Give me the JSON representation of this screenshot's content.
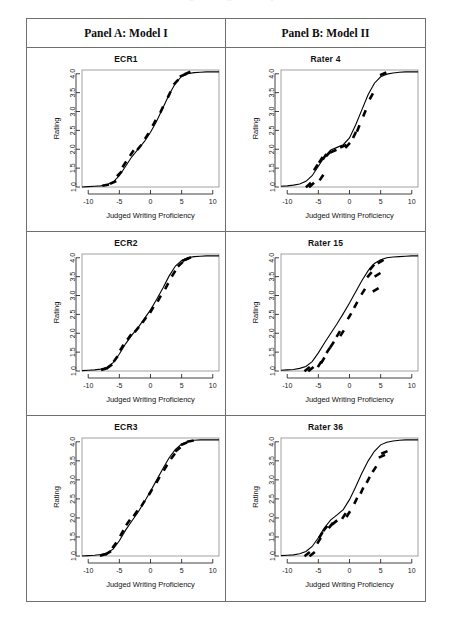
{
  "page": {
    "top_cutoff_text": "Judged Writing Proficiency"
  },
  "figure": {
    "panels": [
      {
        "id": "panel-a",
        "header": "Panel A: Model I"
      },
      {
        "id": "panel-b",
        "header": "Panel B: Model II"
      }
    ],
    "charts": [
      {
        "row": 0,
        "col": 0,
        "title": "ECR1"
      },
      {
        "row": 0,
        "col": 1,
        "title": "Rater 4"
      },
      {
        "row": 1,
        "col": 0,
        "title": "ECR2"
      },
      {
        "row": 1,
        "col": 1,
        "title": "Rater 15"
      },
      {
        "row": 2,
        "col": 0,
        "title": "ECR3"
      },
      {
        "row": 2,
        "col": 1,
        "title": "Rater 36"
      }
    ]
  },
  "chart_data": [
    {
      "id": "ecr1",
      "type": "line",
      "title": "ECR1",
      "panel": "Panel A: Model I",
      "xlabel": "Judged Writing Proficiency",
      "ylabel": "Rating",
      "xlim": [
        -11,
        11
      ],
      "ylim": [
        1.0,
        4.1
      ],
      "xticks": [
        -10,
        -5,
        0,
        5,
        10
      ],
      "yticks": [
        1.0,
        1.5,
        2.0,
        2.5,
        3.0,
        3.5,
        4.0
      ],
      "ytick_labels": [
        "1.0",
        "1.5",
        "2.0",
        "2.5",
        "3.0",
        "3.5",
        "4.0"
      ],
      "xtick_labels": [
        "-10",
        "-5",
        "0",
        "5",
        "10"
      ],
      "grid": false,
      "legend": "none",
      "series": [
        {
          "name": "model-I fitted curve",
          "kind": "curve",
          "x": [
            -11,
            -10,
            -9,
            -8,
            -7,
            -6,
            -5,
            -4,
            -3,
            -2,
            -1,
            0,
            1,
            2,
            3,
            4,
            5,
            6,
            7,
            8,
            9,
            10,
            11
          ],
          "y": [
            1.0,
            1.01,
            1.02,
            1.03,
            1.06,
            1.13,
            1.3,
            1.55,
            1.8,
            2.0,
            2.2,
            2.45,
            2.75,
            3.1,
            3.45,
            3.75,
            3.93,
            4.0,
            4.03,
            4.04,
            4.05,
            4.05,
            4.05
          ]
        },
        {
          "name": "observed residual segments",
          "kind": "segments",
          "x": [
            -7.2,
            -6.0,
            -5.0,
            -4.2,
            -3.0,
            -1.8,
            -0.6,
            0.6,
            1.8,
            3.0,
            4.1,
            5.2,
            5.9
          ],
          "y": [
            1.05,
            1.12,
            1.35,
            1.6,
            1.9,
            2.05,
            2.35,
            2.7,
            3.05,
            3.45,
            3.78,
            3.96,
            4.02
          ]
        }
      ]
    },
    {
      "id": "rater4",
      "type": "line",
      "title": "Rater 4",
      "panel": "Panel B: Model II",
      "xlabel": "Judged Writing Proficiency",
      "ylabel": "Rating",
      "xlim": [
        -11,
        11
      ],
      "ylim": [
        1.0,
        4.1
      ],
      "xticks": [
        -10,
        -5,
        0,
        5,
        10
      ],
      "yticks": [
        1.0,
        1.5,
        2.0,
        2.5,
        3.0,
        3.5,
        4.0
      ],
      "ytick_labels": [
        "1.0",
        "1.5",
        "2.0",
        "2.5",
        "3.0",
        "3.5",
        "4.0"
      ],
      "xtick_labels": [
        "-10",
        "-5",
        "0",
        "5",
        "10"
      ],
      "grid": false,
      "legend": "none",
      "series": [
        {
          "name": "model-II fitted curve",
          "kind": "curve",
          "x": [
            -11,
            -10,
            -9,
            -8,
            -7,
            -6,
            -5,
            -4,
            -3,
            -2,
            -1,
            0,
            1,
            2,
            3,
            4,
            5,
            6,
            7,
            8,
            9,
            10,
            11
          ],
          "y": [
            1.02,
            1.03,
            1.05,
            1.08,
            1.15,
            1.3,
            1.55,
            1.8,
            1.98,
            2.05,
            2.12,
            2.3,
            2.65,
            3.05,
            3.45,
            3.75,
            3.92,
            3.99,
            4.02,
            4.04,
            4.05,
            4.05,
            4.05
          ]
        },
        {
          "name": "observed residual segments",
          "kind": "segments",
          "x": [
            -6.6,
            -6.1,
            -5.4,
            -4.6,
            -4.5,
            -4.0,
            -3.4,
            -2.6,
            -1.0,
            -0.3,
            0.8,
            1.4,
            2.4,
            3.5,
            5.4
          ],
          "y": [
            1.05,
            1.05,
            1.52,
            1.72,
            1.25,
            1.8,
            1.88,
            1.95,
            2.08,
            2.1,
            2.38,
            2.55,
            2.95,
            3.4,
            4.0
          ]
        }
      ]
    },
    {
      "id": "ecr2",
      "type": "line",
      "title": "ECR2",
      "panel": "Panel A: Model I",
      "xlabel": "Judged Writing Proficiency",
      "ylabel": "Rating",
      "xlim": [
        -11,
        11
      ],
      "ylim": [
        1.0,
        4.1
      ],
      "xticks": [
        -10,
        -5,
        0,
        5,
        10
      ],
      "yticks": [
        1.0,
        1.5,
        2.0,
        2.5,
        3.0,
        3.5,
        4.0
      ],
      "ytick_labels": [
        "1.0",
        "1.5",
        "2.0",
        "2.5",
        "3.0",
        "3.5",
        "4.0"
      ],
      "xtick_labels": [
        "-10",
        "-5",
        "0",
        "5",
        "10"
      ],
      "grid": false,
      "legend": "none",
      "series": [
        {
          "name": "model-I fitted curve",
          "kind": "curve",
          "x": [
            -11,
            -10,
            -9,
            -8,
            -7,
            -6,
            -5,
            -4,
            -3,
            -2,
            -1,
            0,
            1,
            2,
            3,
            4,
            5,
            6,
            7,
            8,
            9,
            10,
            11
          ],
          "y": [
            1.01,
            1.02,
            1.03,
            1.05,
            1.1,
            1.22,
            1.45,
            1.72,
            1.95,
            2.15,
            2.38,
            2.62,
            2.9,
            3.2,
            3.52,
            3.78,
            3.93,
            4.0,
            4.03,
            4.04,
            4.05,
            4.05,
            4.05
          ]
        },
        {
          "name": "observed residual segments",
          "kind": "segments",
          "x": [
            -7.4,
            -6.6,
            -5.6,
            -4.6,
            -3.4,
            -2.2,
            -1.0,
            0.2,
            1.4,
            2.6,
            3.7,
            4.8,
            5.6,
            6.0
          ],
          "y": [
            1.05,
            1.12,
            1.32,
            1.62,
            1.9,
            2.1,
            2.35,
            2.62,
            2.92,
            3.25,
            3.58,
            3.83,
            3.95,
            3.98
          ]
        }
      ]
    },
    {
      "id": "rater15",
      "type": "line",
      "title": "Rater 15",
      "panel": "Panel B: Model II",
      "xlabel": "Judged Writing Proficiency",
      "ylabel": "Rating",
      "xlim": [
        -11,
        11
      ],
      "ylim": [
        1.0,
        4.1
      ],
      "xticks": [
        -10,
        -5,
        0,
        5,
        10
      ],
      "yticks": [
        1.0,
        1.5,
        2.0,
        2.5,
        3.0,
        3.5,
        4.0
      ],
      "ytick_labels": [
        "1.0",
        "1.5",
        "2.0",
        "2.5",
        "3.0",
        "3.5",
        "4.0"
      ],
      "xtick_labels": [
        "-10",
        "-5",
        "0",
        "5",
        "10"
      ],
      "grid": false,
      "legend": "none",
      "series": [
        {
          "name": "model-II fitted curve",
          "kind": "curve",
          "x": [
            -11,
            -10,
            -9,
            -8,
            -7,
            -6,
            -5,
            -4,
            -3,
            -2,
            -1,
            0,
            1,
            2,
            3,
            4,
            5,
            6,
            7,
            8,
            9,
            10,
            11
          ],
          "y": [
            1.02,
            1.03,
            1.04,
            1.07,
            1.12,
            1.25,
            1.48,
            1.75,
            2.0,
            2.25,
            2.52,
            2.8,
            3.1,
            3.4,
            3.66,
            3.85,
            3.95,
            4.0,
            4.02,
            4.03,
            4.04,
            4.05,
            4.05
          ]
        },
        {
          "name": "observed residual segments",
          "kind": "segments",
          "x": [
            -6.8,
            -6.2,
            -4.8,
            -4.3,
            -3.4,
            -2.8,
            -1.8,
            -1.2,
            0.0,
            1.0,
            2.2,
            3.2,
            3.6,
            4.2,
            4.5,
            5.0
          ],
          "y": [
            1.05,
            1.05,
            1.18,
            1.28,
            1.55,
            1.7,
            1.98,
            2.0,
            2.45,
            2.75,
            3.1,
            3.55,
            3.75,
            3.15,
            3.55,
            3.9
          ]
        }
      ]
    },
    {
      "id": "ecr3",
      "type": "line",
      "title": "ECR3",
      "panel": "Panel A: Model I",
      "xlabel": "Judged Writing Proficiency",
      "ylabel": "Rating",
      "xlim": [
        -11,
        11
      ],
      "ylim": [
        1.0,
        4.1
      ],
      "xticks": [
        -10,
        -5,
        0,
        5,
        10
      ],
      "yticks": [
        1.0,
        1.5,
        2.0,
        2.5,
        3.0,
        3.5,
        4.0
      ],
      "ytick_labels": [
        "1.0",
        "1.5",
        "2.0",
        "2.5",
        "3.0",
        "3.5",
        "4.0"
      ],
      "xtick_labels": [
        "-10",
        "-5",
        "0",
        "5",
        "10"
      ],
      "grid": false,
      "legend": "none",
      "series": [
        {
          "name": "model-I fitted curve",
          "kind": "curve",
          "x": [
            -11,
            -10,
            -9,
            -8,
            -7,
            -6,
            -5,
            -4,
            -3,
            -2,
            -1,
            0,
            1,
            2,
            3,
            4,
            5,
            6,
            7,
            8,
            9,
            10,
            11
          ],
          "y": [
            1.0,
            1.01,
            1.02,
            1.04,
            1.08,
            1.18,
            1.4,
            1.68,
            1.92,
            2.15,
            2.42,
            2.7,
            3.0,
            3.3,
            3.58,
            3.8,
            3.94,
            4.01,
            4.04,
            4.05,
            4.05,
            4.05,
            4.05
          ]
        },
        {
          "name": "observed residual segments",
          "kind": "segments",
          "x": [
            -7.6,
            -6.8,
            -5.8,
            -4.6,
            -3.6,
            -2.4,
            -1.2,
            0.0,
            1.2,
            2.4,
            3.6,
            4.4,
            5.4,
            6.4
          ],
          "y": [
            1.03,
            1.08,
            1.28,
            1.6,
            1.88,
            2.12,
            2.38,
            2.68,
            3.0,
            3.32,
            3.62,
            3.8,
            3.95,
            4.02
          ]
        }
      ]
    },
    {
      "id": "rater36",
      "type": "line",
      "title": "Rater 36",
      "panel": "Panel B: Model II",
      "xlabel": "Judged Writing Proficiency",
      "ylabel": "Rating",
      "xlim": [
        -11,
        11
      ],
      "ylim": [
        1.0,
        4.1
      ],
      "xticks": [
        -10,
        -5,
        0,
        5,
        10
      ],
      "yticks": [
        1.0,
        1.5,
        2.0,
        2.5,
        3.0,
        3.5,
        4.0
      ],
      "ytick_labels": [
        "1.0",
        "1.5",
        "2.0",
        "2.5",
        "3.0",
        "3.5",
        "4.0"
      ],
      "xtick_labels": [
        "-10",
        "-5",
        "0",
        "5",
        "10"
      ],
      "grid": false,
      "legend": "none",
      "series": [
        {
          "name": "model-II fitted curve",
          "kind": "curve",
          "x": [
            -11,
            -10,
            -9,
            -8,
            -7,
            -6,
            -5,
            -4,
            -3,
            -2,
            -1,
            0,
            1,
            2,
            3,
            4,
            5,
            6,
            7,
            8,
            9,
            10,
            11
          ],
          "y": [
            1.01,
            1.02,
            1.03,
            1.06,
            1.12,
            1.25,
            1.48,
            1.75,
            1.95,
            2.08,
            2.22,
            2.48,
            2.82,
            3.18,
            3.5,
            3.75,
            3.92,
            3.99,
            4.02,
            4.04,
            4.05,
            4.05,
            4.05
          ]
        },
        {
          "name": "observed residual segments",
          "kind": "segments",
          "x": [
            -6.8,
            -6.0,
            -4.9,
            -4.6,
            -3.9,
            -3.0,
            -2.4,
            -0.9,
            -0.2,
            1.0,
            2.0,
            3.0,
            4.0,
            5.2,
            5.6
          ],
          "y": [
            1.05,
            1.05,
            1.4,
            1.55,
            1.72,
            1.8,
            1.88,
            2.05,
            2.1,
            2.45,
            2.72,
            3.0,
            3.28,
            3.62,
            3.72
          ]
        }
      ]
    }
  ]
}
